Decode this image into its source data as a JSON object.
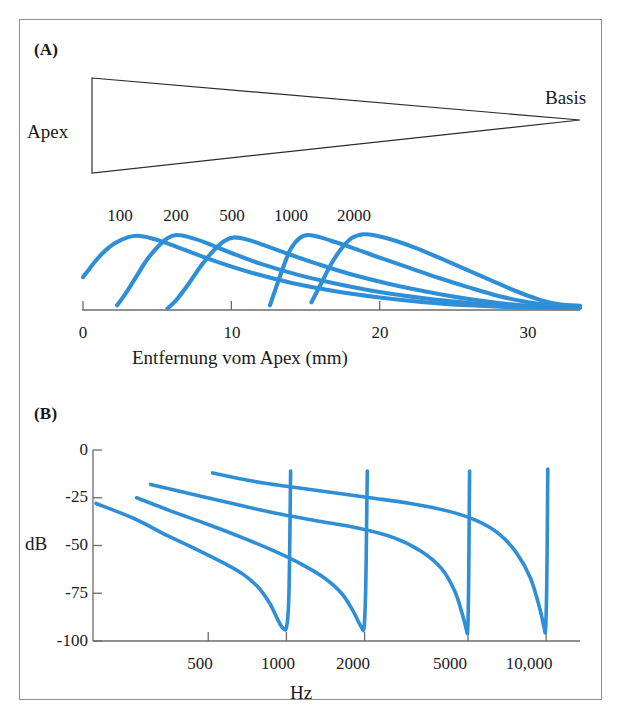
{
  "figure": {
    "background_color": "#ffffff",
    "frame_color": "#8d8d8d",
    "curve_color": "#2e8fd6",
    "axis_color": "#6b6b6b",
    "text_color": "#1a1a1e"
  },
  "panel_a": {
    "tag": "(A)",
    "anatomy": {
      "apex_label": "Apex",
      "basis_label": "Basis"
    },
    "frequency_labels": [
      "100",
      "200",
      "500",
      "1000",
      "2000"
    ],
    "xaxis": {
      "title": "Entfernung vom Apex (mm)",
      "ticks": [
        "0",
        "10",
        "20",
        "30"
      ],
      "tick_values": [
        0,
        10,
        20,
        30
      ],
      "range": [
        0,
        33.5
      ]
    }
  },
  "panel_b": {
    "tag": "(B)",
    "xaxis": {
      "title": "Hz",
      "ticks": [
        "500",
        "1000",
        "2000",
        "5000",
        "10,000"
      ],
      "tick_values": [
        500,
        1000,
        2000,
        5000,
        10000
      ],
      "scale": "log"
    },
    "yaxis": {
      "title": "dB",
      "ticks": [
        "0",
        "-25",
        "-50",
        "-75",
        "-100"
      ],
      "tick_values": [
        0,
        -25,
        -50,
        -75,
        -100
      ],
      "range": [
        -100,
        0
      ]
    }
  },
  "chart_data": [
    {
      "id": "panel-a-traveling-waves",
      "type": "line",
      "title": "(A)",
      "xlabel": "Entfernung vom Apex (mm)",
      "ylabel": "",
      "xlim": [
        0,
        33.5
      ],
      "ylim": [
        0,
        1.05
      ],
      "grid": false,
      "legend": "inline-labels-above-peaks",
      "xticks": [
        0,
        10,
        20,
        30
      ],
      "xticklabels": [
        "0",
        "10",
        "20",
        "30"
      ],
      "series": [
        {
          "name": "100",
          "peak_mm": 3.6,
          "onset_mm": 0.0,
          "end_mm": 33.5,
          "points": [
            [
              0.0,
              0.42
            ],
            [
              0.4,
              0.52
            ],
            [
              0.9,
              0.64
            ],
            [
              1.5,
              0.76
            ],
            [
              2.2,
              0.86
            ],
            [
              3.0,
              0.93
            ],
            [
              3.7,
              0.95
            ],
            [
              4.6,
              0.92
            ],
            [
              5.6,
              0.86
            ],
            [
              7.0,
              0.76
            ],
            [
              9.0,
              0.62
            ],
            [
              11.5,
              0.47
            ],
            [
              14.0,
              0.35
            ],
            [
              17.0,
              0.24
            ],
            [
              20.0,
              0.16
            ],
            [
              23.0,
              0.1
            ],
            [
              26.0,
              0.06
            ],
            [
              29.0,
              0.035
            ],
            [
              31.5,
              0.03
            ],
            [
              33.5,
              0.03
            ]
          ]
        },
        {
          "name": "200",
          "peak_mm": 5.9,
          "onset_mm": 2.3,
          "end_mm": 33.5,
          "points": [
            [
              2.3,
              0.06
            ],
            [
              2.9,
              0.22
            ],
            [
              3.6,
              0.43
            ],
            [
              4.3,
              0.64
            ],
            [
              5.0,
              0.8
            ],
            [
              5.7,
              0.92
            ],
            [
              6.3,
              0.96
            ],
            [
              7.2,
              0.93
            ],
            [
              8.3,
              0.86
            ],
            [
              10.0,
              0.73
            ],
            [
              12.0,
              0.59
            ],
            [
              14.5,
              0.45
            ],
            [
              17.0,
              0.34
            ],
            [
              20.0,
              0.23
            ],
            [
              23.0,
              0.15
            ],
            [
              26.0,
              0.09
            ],
            [
              29.0,
              0.045
            ],
            [
              31.5,
              0.032
            ],
            [
              33.5,
              0.03
            ]
          ]
        },
        {
          "name": "500",
          "peak_mm": 9.8,
          "onset_mm": 5.7,
          "end_mm": 33.5,
          "points": [
            [
              5.7,
              0.02
            ],
            [
              6.3,
              0.13
            ],
            [
              7.1,
              0.33
            ],
            [
              7.9,
              0.55
            ],
            [
              8.7,
              0.74
            ],
            [
              9.5,
              0.88
            ],
            [
              10.2,
              0.93
            ],
            [
              11.1,
              0.9
            ],
            [
              12.2,
              0.83
            ],
            [
              13.8,
              0.72
            ],
            [
              15.8,
              0.59
            ],
            [
              18.0,
              0.46
            ],
            [
              20.5,
              0.34
            ],
            [
              23.0,
              0.24
            ],
            [
              26.0,
              0.14
            ],
            [
              29.0,
              0.07
            ],
            [
              31.5,
              0.04
            ],
            [
              33.5,
              0.035
            ]
          ]
        },
        {
          "name": "1000",
          "peak_mm": 14.2,
          "onset_mm": 12.6,
          "end_mm": 33.5,
          "points": [
            [
              12.6,
              0.06
            ],
            [
              13.0,
              0.28
            ],
            [
              13.5,
              0.55
            ],
            [
              14.0,
              0.78
            ],
            [
              14.6,
              0.92
            ],
            [
              15.2,
              0.96
            ],
            [
              16.0,
              0.93
            ],
            [
              17.0,
              0.87
            ],
            [
              18.4,
              0.78
            ],
            [
              20.0,
              0.67
            ],
            [
              22.0,
              0.54
            ],
            [
              24.0,
              0.41
            ],
            [
              26.0,
              0.29
            ],
            [
              28.0,
              0.18
            ],
            [
              30.0,
              0.1
            ],
            [
              32.0,
              0.055
            ],
            [
              33.5,
              0.045
            ]
          ]
        },
        {
          "name": "2000",
          "peak_mm": 18.6,
          "onset_mm": 15.4,
          "end_mm": 33.5,
          "points": [
            [
              15.4,
              0.1
            ],
            [
              16.0,
              0.32
            ],
            [
              16.7,
              0.58
            ],
            [
              17.4,
              0.78
            ],
            [
              18.1,
              0.92
            ],
            [
              18.9,
              0.97
            ],
            [
              19.8,
              0.95
            ],
            [
              21.0,
              0.89
            ],
            [
              22.5,
              0.79
            ],
            [
              24.0,
              0.67
            ],
            [
              25.8,
              0.52
            ],
            [
              27.5,
              0.38
            ],
            [
              29.2,
              0.24
            ],
            [
              30.8,
              0.13
            ],
            [
              32.2,
              0.07
            ],
            [
              33.5,
              0.055
            ]
          ]
        }
      ]
    },
    {
      "id": "panel-b-tuning-curves",
      "type": "line",
      "title": "(B)",
      "xlabel": "Hz",
      "ylabel": "dB",
      "xscale": "log",
      "xlim": [
        180,
        13500
      ],
      "ylim": [
        -100,
        0
      ],
      "grid": false,
      "xticks": [
        500,
        1000,
        2000,
        5000,
        10000
      ],
      "xticklabels": [
        "500",
        "1000",
        "2000",
        "5000",
        "10,000"
      ],
      "yticks": [
        0,
        -25,
        -50,
        -75,
        -100
      ],
      "yticklabels": [
        "0",
        "-25",
        "-50",
        "-75",
        "-100"
      ],
      "series": [
        {
          "name": "1000 Hz place",
          "notch_hz": 1000,
          "notch_db": -93,
          "points": [
            [
              185,
              -28
            ],
            [
              260,
              -36
            ],
            [
              350,
              -45
            ],
            [
              450,
              -52
            ],
            [
              570,
              -59
            ],
            [
              680,
              -65
            ],
            [
              780,
              -72
            ],
            [
              860,
              -80
            ],
            [
              920,
              -88
            ],
            [
              965,
              -93
            ],
            [
              1000,
              -93
            ],
            [
              1020,
              -80
            ],
            [
              1030,
              -50
            ],
            [
              1035,
              -25
            ],
            [
              1038,
              -11
            ]
          ]
        },
        {
          "name": "2000 Hz place",
          "notch_hz": 2000,
          "notch_db": -93,
          "points": [
            [
              265,
              -25
            ],
            [
              360,
              -32
            ],
            [
              500,
              -39
            ],
            [
              680,
              -46
            ],
            [
              900,
              -53
            ],
            [
              1150,
              -60
            ],
            [
              1400,
              -67
            ],
            [
              1630,
              -75
            ],
            [
              1800,
              -84
            ],
            [
              1930,
              -92
            ],
            [
              1990,
              -93
            ],
            [
              2020,
              -72
            ],
            [
              2035,
              -40
            ],
            [
              2045,
              -18
            ],
            [
              2050,
              -11
            ]
          ]
        },
        {
          "name": "5000 Hz place",
          "notch_hz": 5000,
          "notch_db": -94,
          "points": [
            [
              300,
              -18
            ],
            [
              430,
              -23
            ],
            [
              620,
              -28
            ],
            [
              900,
              -33
            ],
            [
              1300,
              -37
            ],
            [
              1900,
              -41
            ],
            [
              2600,
              -46
            ],
            [
              3300,
              -53
            ],
            [
              3950,
              -62
            ],
            [
              4450,
              -74
            ],
            [
              4780,
              -87
            ],
            [
              4930,
              -94
            ],
            [
              4990,
              -94
            ],
            [
              5030,
              -70
            ],
            [
              5055,
              -35
            ],
            [
              5070,
              -15
            ],
            [
              5075,
              -11
            ]
          ]
        },
        {
          "name": "10000 Hz place",
          "notch_hz": 10000,
          "notch_db": -94,
          "points": [
            [
              520,
              -12
            ],
            [
              720,
              -16
            ],
            [
              1000,
              -19
            ],
            [
              1450,
              -22
            ],
            [
              2100,
              -25
            ],
            [
              3000,
              -28
            ],
            [
              4200,
              -32
            ],
            [
              5400,
              -37
            ],
            [
              6600,
              -44
            ],
            [
              7700,
              -54
            ],
            [
              8700,
              -67
            ],
            [
              9450,
              -83
            ],
            [
              9820,
              -93
            ],
            [
              9950,
              -94
            ],
            [
              10050,
              -72
            ],
            [
              10110,
              -38
            ],
            [
              10140,
              -16
            ],
            [
              10150,
              -10
            ]
          ]
        }
      ]
    }
  ]
}
